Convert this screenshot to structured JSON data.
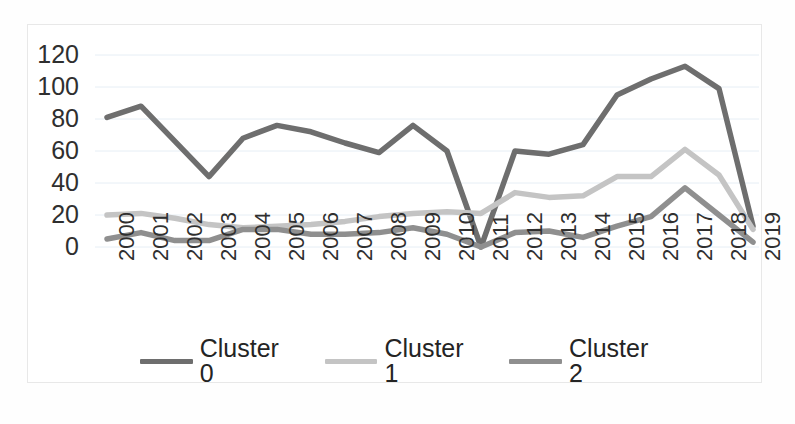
{
  "chart_data": {
    "type": "line",
    "title": "",
    "xlabel": "",
    "ylabel": "",
    "categories": [
      "2000",
      "2001",
      "2002",
      "2003",
      "2004",
      "2005",
      "2006",
      "2007",
      "2008",
      "2009",
      "2010",
      "2011",
      "2012",
      "2013",
      "2014",
      "2015",
      "2016",
      "2017",
      "2018",
      "2019"
    ],
    "ylim": [
      0,
      130
    ],
    "y_ticks": [
      "0",
      "20",
      "40",
      "60",
      "80",
      "100",
      "120"
    ],
    "y_tick_values": [
      0,
      20,
      40,
      60,
      80,
      100,
      120
    ],
    "grid": true,
    "legend_position": "bottom",
    "series": [
      {
        "name": "Cluster 0",
        "color": "#6e6e6e",
        "values": [
          81,
          88,
          66,
          44,
          68,
          76,
          72,
          65,
          59,
          76,
          60,
          0,
          60,
          58,
          64,
          95,
          105,
          113,
          99,
          13
        ]
      },
      {
        "name": "Cluster 1",
        "color": "#c4c4c4",
        "values": [
          20,
          21,
          18,
          14,
          12,
          13,
          14,
          16,
          19,
          21,
          22,
          21,
          34,
          31,
          32,
          44,
          44,
          61,
          45,
          11
        ]
      },
      {
        "name": "Cluster 2",
        "color": "#8f8f8f",
        "values": [
          5,
          9,
          4,
          4,
          11,
          11,
          8,
          8,
          9,
          12,
          8,
          0,
          9,
          10,
          6,
          13,
          19,
          37,
          20,
          3
        ]
      }
    ]
  },
  "legend": {
    "items": [
      {
        "label": "Cluster 0"
      },
      {
        "label": "Cluster 1"
      },
      {
        "label": "Cluster 2"
      }
    ]
  },
  "colors": {
    "cluster_0": "#6e6e6e",
    "cluster_1": "#c4c4c4",
    "cluster_2": "#8f8f8f",
    "gridline": "#e6eef5",
    "frame_border": "#e8e8e8",
    "text": "#2f2f2f",
    "background": "#ffffff"
  }
}
